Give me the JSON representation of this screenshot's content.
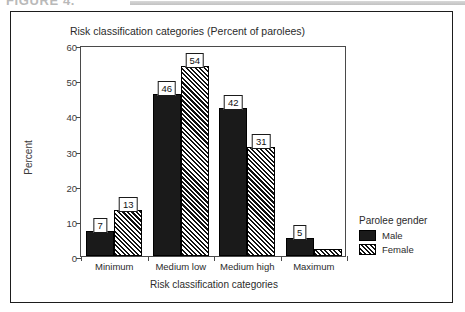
{
  "figure_caption": {
    "text": "FIGURE 4."
  },
  "chart_data": {
    "type": "bar",
    "title": "Risk classification categories (Percent of parolees)",
    "xlabel": "Risk classification categories",
    "ylabel": "Percent",
    "categories": [
      "Minimum",
      "Medium low",
      "Medium high",
      "Maximum"
    ],
    "series": [
      {
        "name": "Male",
        "values": [
          7,
          46,
          42,
          5
        ],
        "labels": [
          "7",
          "46",
          "42",
          "5"
        ],
        "color": "#1a1a1a",
        "fill": "solid"
      },
      {
        "name": "Female",
        "values": [
          13,
          54,
          31,
          2
        ],
        "labels": [
          "13",
          "54",
          "31",
          ""
        ],
        "color": "#111111",
        "fill": "diagonal-hatch"
      }
    ],
    "ylim": [
      0,
      60
    ],
    "yticks": [
      0,
      10,
      20,
      30,
      40,
      50,
      60
    ],
    "ytick_labels": [
      "0",
      "10",
      "20",
      "30",
      "40",
      "50",
      "60"
    ],
    "grid": false,
    "legend": {
      "title": "Parolee gender",
      "position": "right",
      "entries": [
        "Male",
        "Female"
      ]
    }
  }
}
